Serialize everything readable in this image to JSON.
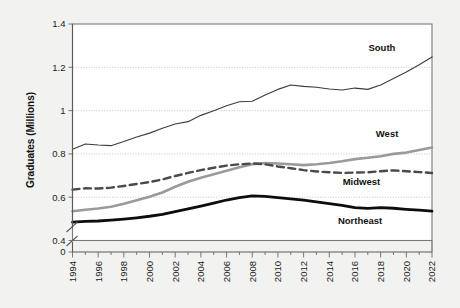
{
  "chart_data": {
    "type": "line",
    "title": "",
    "xlabel": "",
    "ylabel": "Graduates (Millions)",
    "xlim": [
      1994,
      2022
    ],
    "ylim": [
      0.4,
      1.4
    ],
    "y_axis_break": true,
    "y_break_from": 0,
    "y_break_to": 0.4,
    "grid": true,
    "gridlines_y": [
      0.6,
      0.8,
      1.0,
      1.2
    ],
    "legend_position": "inline-right-labels",
    "ytick_labels": [
      "0",
      "0.4",
      "0.6",
      "0.8",
      "1",
      "1.2",
      "1.4"
    ],
    "ytick_values": [
      0,
      0.4,
      0.6,
      0.8,
      1.0,
      1.2,
      1.4
    ],
    "xtick_labels": [
      "1994",
      "1996",
      "1998",
      "2000",
      "2002",
      "2004",
      "2006",
      "2008",
      "2010",
      "2012",
      "2014",
      "2016",
      "2018",
      "2020",
      "2022"
    ],
    "xtick_values": [
      1994,
      1996,
      1998,
      2000,
      2002,
      2004,
      2006,
      2008,
      2010,
      2012,
      2014,
      2016,
      2018,
      2020,
      2022
    ],
    "x": [
      1994,
      1995,
      1996,
      1997,
      1998,
      1999,
      2000,
      2001,
      2002,
      2003,
      2004,
      2005,
      2006,
      2007,
      2008,
      2009,
      2010,
      2011,
      2012,
      2013,
      2014,
      2015,
      2016,
      2017,
      2018,
      2019,
      2020,
      2021,
      2022
    ],
    "series": [
      {
        "name": "South",
        "color": "#3c3c3c",
        "style": "solid",
        "width": 1.1,
        "label_x": 2018.1,
        "label_y": 1.275,
        "values": [
          0.822,
          0.846,
          0.841,
          0.838,
          0.857,
          0.878,
          0.896,
          0.918,
          0.938,
          0.949,
          0.978,
          0.999,
          1.022,
          1.041,
          1.043,
          1.072,
          1.098,
          1.118,
          1.112,
          1.108,
          1.1,
          1.095,
          1.104,
          1.098,
          1.118,
          1.148,
          1.178,
          1.212,
          1.248
        ]
      },
      {
        "name": "West",
        "color": "#9a9a9a",
        "style": "solid",
        "width": 2.6,
        "label_x": 2018.5,
        "label_y": 0.878,
        "values": [
          0.535,
          0.542,
          0.548,
          0.556,
          0.57,
          0.586,
          0.602,
          0.622,
          0.648,
          0.671,
          0.69,
          0.706,
          0.722,
          0.738,
          0.752,
          0.758,
          0.756,
          0.752,
          0.748,
          0.752,
          0.758,
          0.766,
          0.776,
          0.782,
          0.789,
          0.8,
          0.806,
          0.818,
          0.83
        ]
      },
      {
        "name": "Midwest",
        "color": "#4a4a4a",
        "style": "dashed",
        "width": 2.4,
        "label_x": 2016.5,
        "label_y": 0.658,
        "values": [
          0.635,
          0.641,
          0.64,
          0.644,
          0.652,
          0.661,
          0.67,
          0.682,
          0.698,
          0.712,
          0.725,
          0.736,
          0.746,
          0.752,
          0.756,
          0.752,
          0.742,
          0.734,
          0.725,
          0.719,
          0.715,
          0.712,
          0.714,
          0.715,
          0.72,
          0.724,
          0.72,
          0.716,
          0.712
        ]
      },
      {
        "name": "Northeast",
        "color": "#0d0d0d",
        "style": "solid",
        "width": 2.8,
        "label_x": 2016.4,
        "label_y": 0.478,
        "values": [
          0.485,
          0.488,
          0.49,
          0.494,
          0.499,
          0.505,
          0.512,
          0.521,
          0.533,
          0.546,
          0.559,
          0.573,
          0.587,
          0.598,
          0.606,
          0.604,
          0.598,
          0.592,
          0.586,
          0.578,
          0.57,
          0.562,
          0.552,
          0.548,
          0.552,
          0.549,
          0.544,
          0.54,
          0.536
        ]
      }
    ]
  }
}
